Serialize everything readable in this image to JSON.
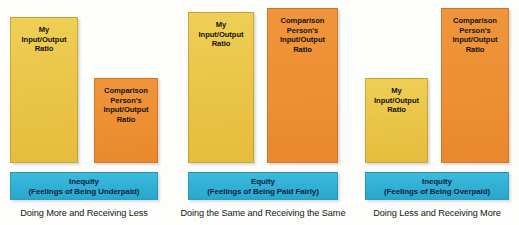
{
  "figure": {
    "colors": {
      "mine_bar": "#e9c445",
      "comparison_bar": "#ed8f33",
      "banner": "#31b0d5",
      "banner_text": "#10243f",
      "bar_label_text": "#141414",
      "caption_text": "#151515",
      "background": "#ffffff"
    },
    "baseline_y": 163
  },
  "chart_data": {
    "type": "bar",
    "xlabel": "",
    "ylabel": "Input/Output Ratio",
    "grid": false,
    "legend_position": "none",
    "categories": [
      "Doing More and Receiving Less",
      "Doing the Same and Receiving the Same",
      "Doing Less and Receiving More"
    ],
    "series": [
      {
        "name": "My Input/Output Ratio",
        "values": [
          146,
          151,
          85
        ]
      },
      {
        "name": "Comparison Person's Input/Output Ratio",
        "values": [
          85,
          155,
          155
        ]
      }
    ],
    "outcomes": [
      "Inequity",
      "Equity",
      "Inequity"
    ]
  },
  "panels": [
    {
      "id": "underpaid",
      "bars": [
        {
          "id": "my-ratio",
          "type": "mine",
          "label_lines": [
            "My",
            "Input/Output",
            "Ratio"
          ],
          "x": 10,
          "width": 68,
          "top": 17,
          "height": 146
        },
        {
          "id": "comparison-ratio",
          "type": "comparison",
          "label_lines": [
            "Comparison",
            "Person's",
            "Input/Output",
            "Ratio"
          ],
          "x": 94,
          "width": 64,
          "top": 78,
          "height": 85
        }
      ],
      "banner": {
        "x": 10,
        "width": 148,
        "top": 172,
        "height": 28,
        "line1": "Inequity",
        "line2": "(Feelings of Being Underpaid)"
      },
      "caption": {
        "text": "Doing More and Receiving Less",
        "x": 10,
        "width": 148,
        "top": 208
      }
    },
    {
      "id": "paid-fairly",
      "bars": [
        {
          "id": "my-ratio",
          "type": "mine",
          "label_lines": [
            "My",
            "Input/Output",
            "Ratio"
          ],
          "x": 188,
          "width": 66,
          "top": 12,
          "height": 151
        },
        {
          "id": "comparison-ratio",
          "type": "comparison",
          "label_lines": [
            "Comparison",
            "Person's",
            "Input/Output",
            "Ratio"
          ],
          "x": 267,
          "width": 71,
          "top": 8,
          "height": 155
        }
      ],
      "banner": {
        "x": 188,
        "width": 150,
        "top": 172,
        "height": 28,
        "line1": "Equity",
        "line2": "(Feelings of Being Paid Fairly)"
      },
      "caption": {
        "text": "Doing the Same and Receiving the Same",
        "x": 178,
        "width": 170,
        "top": 208
      }
    },
    {
      "id": "overpaid",
      "bars": [
        {
          "id": "my-ratio",
          "type": "mine",
          "label_lines": [
            "My",
            "Input/Output",
            "Ratio"
          ],
          "x": 365,
          "width": 63,
          "top": 78,
          "height": 85
        },
        {
          "id": "comparison-ratio",
          "type": "comparison",
          "label_lines": [
            "Comparison",
            "Person's",
            "Input/Output",
            "Ratio"
          ],
          "x": 441,
          "width": 68,
          "top": 8,
          "height": 155
        }
      ],
      "banner": {
        "x": 365,
        "width": 144,
        "top": 172,
        "height": 28,
        "line1": "Inequity",
        "line2": "(Feelings of Being Overpaid)"
      },
      "caption": {
        "text": "Doing Less and Receiving More",
        "x": 362,
        "width": 150,
        "top": 208
      }
    }
  ]
}
